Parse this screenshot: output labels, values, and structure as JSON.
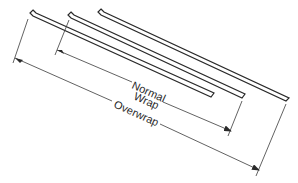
{
  "diagram": {
    "labels": {
      "normal_line1": "Normal",
      "normal_line2": "Wrap",
      "overwrap": "Overwrap"
    },
    "strips": [
      {
        "name": "strip-1"
      },
      {
        "name": "strip-2"
      },
      {
        "name": "strip-3"
      }
    ],
    "colors": {
      "line": "#2a2a2a",
      "background": "#ffffff"
    }
  }
}
